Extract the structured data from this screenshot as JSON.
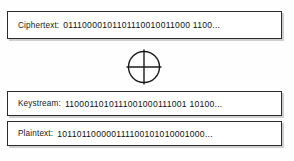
{
  "diagram": {
    "type": "stream-cipher-xor-decryption",
    "rows": [
      {
        "name": "ciphertext",
        "label": "Ciphertext:",
        "bits": "01110000101101110010011000 1100..."
      },
      {
        "name": "keystream",
        "label": "Keystream:",
        "bits": "1100011010111001000111001 10100..."
      },
      {
        "name": "plaintext",
        "label": "Plaintext:",
        "bits": "101101100000111100101010001000..."
      }
    ],
    "operator": {
      "name": "xor-operator",
      "glyph": "circled-plus",
      "symbol": "⊕"
    },
    "colors": {
      "box_border": "#2b2b2b",
      "box_fill": "#ffffff",
      "text": "#111111",
      "shadow": "#969696",
      "page_background": "#fefefe"
    }
  }
}
